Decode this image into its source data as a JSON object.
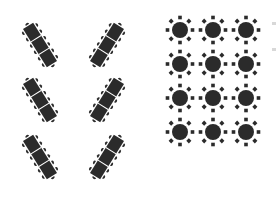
{
  "diagram": {
    "title": "",
    "colors": {
      "table": "#2b2b2b",
      "chair": "#2b2b2b",
      "background": "#ffffff",
      "divider": "#ffffff"
    },
    "banquet_layout": {
      "style": "herringbone",
      "table_segments": 3,
      "chairs_per_side_per_segment": 2,
      "tables": [
        {
          "id": "L1",
          "cx": 40,
          "cy": 45,
          "angle": -32
        },
        {
          "id": "L2",
          "cx": 40,
          "cy": 100,
          "angle": -32
        },
        {
          "id": "L3",
          "cx": 40,
          "cy": 157,
          "angle": -32
        },
        {
          "id": "R1",
          "cx": 107,
          "cy": 45,
          "angle": 32
        },
        {
          "id": "R2",
          "cx": 107,
          "cy": 100,
          "angle": 32
        },
        {
          "id": "R3",
          "cx": 107,
          "cy": 157,
          "angle": 32
        }
      ]
    },
    "round_layout": {
      "rows": 4,
      "cols": 3,
      "chairs_per_table": 8,
      "col_x": [
        180,
        213,
        246
      ],
      "row_y": [
        30,
        64,
        98,
        132
      ],
      "table_radius": 8,
      "chair_orbit": 12.5,
      "chair_size": 3.6
    }
  }
}
